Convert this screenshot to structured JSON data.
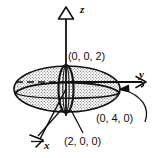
{
  "figure": {
    "type": "3d-ellipsoid-coordinate-diagram",
    "background_color": "#ffffff",
    "ink_color": "#111111"
  },
  "axes": [
    {
      "name": "z-axis",
      "label": "z",
      "direction": "up",
      "arrowhead": "open-triangle"
    },
    {
      "name": "y-axis",
      "label": "y",
      "direction": "right",
      "arrowhead": "open-barb"
    },
    {
      "name": "x-axis",
      "label": "x",
      "direction": "down-left-toward-viewer",
      "arrowhead": "open-barb"
    }
  ],
  "labels": {
    "z": "z",
    "y": "y",
    "x": "x"
  },
  "points": [
    {
      "name": "z-intercept",
      "label": "(0, 0, 2)",
      "coords": [
        0,
        0,
        2
      ]
    },
    {
      "name": "y-intercept",
      "label": "(0, 4, 0)",
      "coords": [
        0,
        4,
        0
      ]
    },
    {
      "name": "x-intercept",
      "label": "(2, 0, 0)",
      "coords": [
        2,
        0,
        0
      ]
    }
  ],
  "point_labels": {
    "z_intercept": "(0, 0, 2)",
    "y_intercept": "(0, 4, 0)",
    "x_intercept": "(2, 0, 0)"
  },
  "surface": {
    "name": "ellipsoid",
    "semi_axes": {
      "x": 2,
      "y": 4,
      "z": 2
    },
    "fill": "stipple-dots",
    "fill_color": "#d8d8d8",
    "outline_color": "#111111"
  },
  "cross_sections": [
    {
      "name": "equatorial-xy-ellipse",
      "plane": "xy",
      "style": "solid"
    },
    {
      "name": "xz-ellipse",
      "plane": "xz",
      "style": "solid"
    },
    {
      "name": "hidden-y-axis-segment",
      "plane": "interior",
      "style": "dashed"
    }
  ],
  "leaders": [
    {
      "name": "leader-to-y-intercept",
      "from": "(0, 4, 0)",
      "to": "y-axis-surface-point",
      "style": "curved-with-arrow"
    },
    {
      "name": "leader-to-x-intercept",
      "from": "(2, 0, 0)",
      "to": "xz-ellipse-front",
      "style": "straight"
    },
    {
      "name": "leader-to-x-axis",
      "from": "x-axis-arrow",
      "to": "ellipsoid-front-lower",
      "style": "straight"
    }
  ]
}
